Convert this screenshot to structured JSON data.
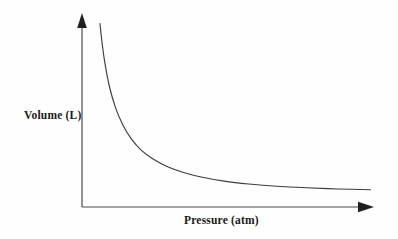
{
  "chart_data": {
    "type": "line",
    "title": "",
    "subtitle": "",
    "xlabel": "Pressure (atm)",
    "ylabel": "Volume (L)",
    "grid": false,
    "legend": null,
    "legend_position": "none",
    "annotations": [],
    "xticks": [],
    "yticks": [],
    "xlim": [
      0,
      10
    ],
    "ylim": [
      0,
      10
    ],
    "relationship": "inverse",
    "series": [
      {
        "name": "Volume vs Pressure",
        "color": "#3d3d3d",
        "x": [
          0.62,
          0.7,
          0.8,
          0.95,
          1.15,
          1.4,
          1.7,
          2.05,
          2.45,
          2.95,
          3.5,
          4.15,
          4.9,
          5.75,
          6.7,
          7.75,
          8.85,
          9.95
        ],
        "values": [
          9.55,
          8.45,
          7.4,
          6.25,
          5.2,
          4.3,
          3.55,
          2.95,
          2.5,
          2.1,
          1.8,
          1.55,
          1.35,
          1.2,
          1.08,
          1.0,
          0.94,
          0.9
        ]
      }
    ],
    "axis_style": {
      "arrowheads": true,
      "axis_color": "#4a4a4a",
      "line_width": 1.1
    }
  },
  "figure": {
    "background": "#fefefe",
    "curve_color": "#3d3d3d"
  }
}
